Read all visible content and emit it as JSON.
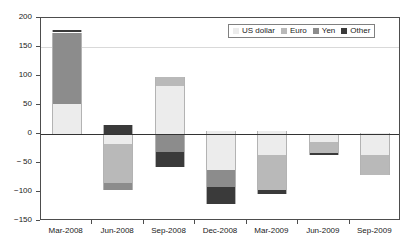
{
  "chart_data": {
    "type": "bar",
    "stacked": true,
    "title": "",
    "subtitle": "",
    "xlabel": "",
    "ylabel": "",
    "ylim": [
      -150,
      200
    ],
    "ytick_values": [
      200,
      150,
      100,
      50,
      0,
      -50,
      -100,
      -150
    ],
    "ytick_labels": [
      "200",
      "150",
      "100",
      "50",
      "0",
      "− 50",
      "−100",
      "−150"
    ],
    "gridlines": [
      150
    ],
    "grid": true,
    "legend_position": "top-right",
    "categories": [
      "Mar-2008",
      "Jun-2008",
      "Sep-2008",
      "Dec-2008",
      "Mar-2009",
      "Jun-2009",
      "Sep-2009"
    ],
    "series": [
      {
        "name": "US dollar",
        "color": "#ececec",
        "values": [
          52,
          -17,
          82,
          -62,
          -36,
          -14,
          -37
        ]
      },
      {
        "name": "Euro",
        "color": "#b9b9b9",
        "values": [
          0,
          -68,
          17,
          0,
          -61,
          -19,
          -34
        ]
      },
      {
        "name": "Yen",
        "color": "#8c8c8c",
        "values": [
          123,
          -12,
          -31,
          -29,
          0,
          0,
          0
        ]
      },
      {
        "name": "Other",
        "color": "#3a3a3a",
        "values": [
          5,
          16,
          -26,
          -30,
          -7,
          -3,
          0
        ]
      }
    ],
    "bar_stacks": [
      {
        "category": "Mar-2008",
        "positive": [
          {
            "series": "US dollar",
            "from": 0,
            "to": 52
          },
          {
            "series": "Yen",
            "from": 52,
            "to": 175
          },
          {
            "series": "Other",
            "from": 175,
            "to": 180
          }
        ],
        "negative": [],
        "net": 180
      },
      {
        "category": "Jun-2008",
        "positive": [
          {
            "series": "Other",
            "from": 0,
            "to": 16
          }
        ],
        "negative": [
          {
            "series": "US dollar",
            "from": 0,
            "to": -17
          },
          {
            "series": "Euro",
            "from": -17,
            "to": -85
          },
          {
            "series": "Yen",
            "from": -85,
            "to": -97
          }
        ],
        "net": -81
      },
      {
        "category": "Sep-2008",
        "positive": [
          {
            "series": "US dollar",
            "from": 0,
            "to": 82
          },
          {
            "series": "Euro",
            "from": 82,
            "to": 99
          }
        ],
        "negative": [
          {
            "series": "Yen",
            "from": 0,
            "to": -31
          },
          {
            "series": "Other",
            "from": -31,
            "to": -57
          }
        ],
        "net": 42
      },
      {
        "category": "Dec-2008",
        "positive": [
          {
            "series": "US dollar",
            "from": 0,
            "to": 5
          }
        ],
        "negative": [
          {
            "series": "US dollar",
            "from": 0,
            "to": -62
          },
          {
            "series": "Yen",
            "from": -62,
            "to": -91
          },
          {
            "series": "Other",
            "from": -91,
            "to": -121
          }
        ],
        "net": -116
      },
      {
        "category": "Mar-2009",
        "positive": [
          {
            "series": "US dollar",
            "from": 0,
            "to": 5
          }
        ],
        "negative": [
          {
            "series": "US dollar",
            "from": 0,
            "to": -36
          },
          {
            "series": "Euro",
            "from": -36,
            "to": -97
          },
          {
            "series": "Other",
            "from": -97,
            "to": -104
          }
        ],
        "net": -99
      },
      {
        "category": "Jun-2009",
        "positive": [],
        "negative": [
          {
            "series": "US dollar",
            "from": 0,
            "to": -14
          },
          {
            "series": "Euro",
            "from": -14,
            "to": -33
          },
          {
            "series": "Other",
            "from": -33,
            "to": -36
          }
        ],
        "net": -36
      },
      {
        "category": "Sep-2009",
        "positive": [
          {
            "series": "US dollar",
            "from": 0,
            "to": 2
          }
        ],
        "negative": [
          {
            "series": "US dollar",
            "from": 0,
            "to": -37
          },
          {
            "series": "Euro",
            "from": -37,
            "to": -71
          }
        ],
        "net": -69
      }
    ]
  },
  "legend": {
    "items": [
      {
        "label": "US dollar",
        "color": "#ececec"
      },
      {
        "label": "Euro",
        "color": "#b9b9b9"
      },
      {
        "label": "Yen",
        "color": "#8c8c8c"
      },
      {
        "label": "Other",
        "color": "#3a3a3a"
      }
    ]
  },
  "colors": {
    "axis": "#4d4d4d",
    "zero_line": "#333333",
    "gridline": "#d9d9d9",
    "text": "#1a1a1a",
    "background": "#ffffff"
  }
}
